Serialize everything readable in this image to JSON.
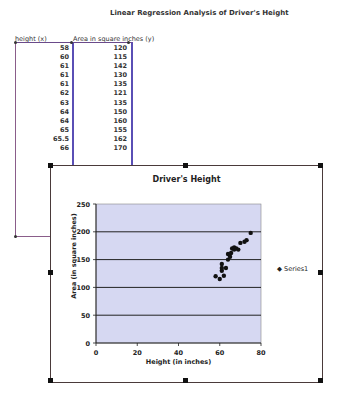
{
  "page": {
    "title": "Linear Regression Analysis of Driver's Height"
  },
  "table": {
    "headers": [
      "height (x)",
      "Area in square inches (y)"
    ],
    "rows": [
      [
        "58",
        "120"
      ],
      [
        "60",
        "115"
      ],
      [
        "61",
        "142"
      ],
      [
        "61",
        "130"
      ],
      [
        "61",
        "135"
      ],
      [
        "62",
        "121"
      ],
      [
        "63",
        "135"
      ],
      [
        "64",
        "150"
      ],
      [
        "64",
        "160"
      ],
      [
        "65",
        "155"
      ],
      [
        "65.5",
        "162"
      ],
      [
        "66",
        "170"
      ]
    ]
  },
  "chart_data": {
    "type": "scatter",
    "title": "Driver's Height",
    "xlabel": "Height (in inches)",
    "ylabel": "Area (in square inches)",
    "xlim": [
      0,
      80
    ],
    "ylim": [
      0,
      250
    ],
    "xticks": [
      0,
      20,
      40,
      60,
      80
    ],
    "yticks": [
      0,
      50,
      100,
      150,
      200,
      250
    ],
    "grid": "horizontal",
    "legend_position": "right",
    "series": [
      {
        "name": "Series1",
        "x": [
          58,
          60,
          61,
          61,
          61,
          62,
          63,
          64,
          64,
          65,
          65.5,
          66,
          67,
          67,
          68,
          69,
          70,
          72,
          73,
          75
        ],
        "y": [
          120,
          115,
          142,
          130,
          135,
          121,
          135,
          150,
          160,
          155,
          162,
          170,
          168,
          172,
          170,
          168,
          180,
          182,
          185,
          198
        ]
      }
    ]
  },
  "legend": {
    "label": "Series1"
  }
}
